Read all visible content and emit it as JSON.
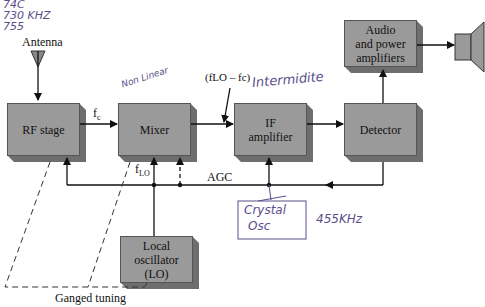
{
  "diagram": {
    "blocks": {
      "rf_stage": "RF stage",
      "mixer": "Mixer",
      "if_amplifier_line1": "IF",
      "if_amplifier_line2": "amplifier",
      "detector": "Detector",
      "audio_line1": "Audio",
      "audio_line2": "and power",
      "audio_line3": "amplifiers",
      "lo_line1": "Local",
      "lo_line2": "oscillator",
      "lo_line3": "(LO)"
    },
    "labels": {
      "antenna": "Antenna",
      "fc": "f",
      "fc_sub": "c",
      "flo": "f",
      "flo_sub": "LO",
      "if_freq": "(fLO – fc)",
      "agc": "AGC",
      "ganged_tuning": "Ganged tuning"
    },
    "handwritten": {
      "top_left_1": "74C",
      "top_left_2": "730 KHZ",
      "top_left_3": "755",
      "non_linear": "Non Linear",
      "intermediate": "Intermidite",
      "crystal_1": "Crystal",
      "crystal_2": "Osc",
      "freq_455": "455KHz"
    },
    "colors": {
      "block_fill": "#9a9a9a",
      "block_shadow": "#6e6e6e",
      "ink": "#5a4d8a"
    }
  }
}
